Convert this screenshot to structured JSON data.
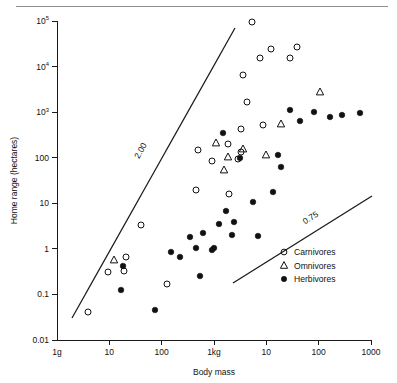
{
  "figure": {
    "has_top_rule": true,
    "background_color": "#ffffff",
    "ink_color": "#111111"
  },
  "chart_data": {
    "type": "scatter",
    "title": "",
    "subtitle": "",
    "xlabel": "Body mass",
    "ylabel": "Home range (hectares)",
    "xscale": "log",
    "yscale": "log",
    "grid": false,
    "xlim": [
      1,
      1000000
    ],
    "ylim": [
      0.01,
      100000
    ],
    "x_tick_labels": [
      "1g",
      "10",
      "100",
      "1kg",
      "10",
      "100",
      "1000"
    ],
    "x_tick_values": [
      1,
      10,
      100,
      1000,
      10000,
      100000,
      1000000
    ],
    "y_tick_labels": [
      "0.01",
      "0.1",
      "1",
      "10",
      "100",
      "10³",
      "10⁴",
      "10⁵"
    ],
    "y_tick_values": [
      0.01,
      0.1,
      1,
      10,
      100,
      1000,
      10000,
      100000
    ],
    "y_tick_mantissas": [
      "0.01",
      "0.1",
      "1",
      "10",
      "100",
      "10",
      "10",
      "10"
    ],
    "y_tick_exponents": [
      "",
      "",
      "",
      "",
      "",
      "3",
      "4",
      "5"
    ],
    "legend_position": "lower-right",
    "legend": [
      {
        "label": "Carnivores",
        "marker": "open-circle"
      },
      {
        "label": "Omnivores",
        "marker": "open-triangle"
      },
      {
        "label": "Herbivores",
        "marker": "filled-circle"
      }
    ],
    "annotations": [
      {
        "text": "2.00",
        "role": "slope-label",
        "line": "steep-regression-line",
        "rotation": -62
      },
      {
        "text": "0.75",
        "role": "slope-label",
        "line": "shallow-regression-line",
        "rotation": -32
      }
    ],
    "reference_lines": [
      {
        "name": "steep-regression-line",
        "slope_label": "2.00",
        "px": [
          [
            72,
            318
          ],
          [
            235,
            28
          ]
        ]
      },
      {
        "name": "shallow-regression-line",
        "slope_label": "0.75",
        "px": [
          [
            233,
            283
          ],
          [
            372,
            196
          ]
        ]
      }
    ],
    "series": [
      {
        "name": "Carnivores",
        "marker": "open-circle",
        "points_px": [
          [
            88,
            312
          ],
          [
            108,
            272
          ],
          [
            124,
            271
          ],
          [
            126,
            257
          ],
          [
            141,
            225
          ],
          [
            167,
            284
          ],
          [
            196,
            190
          ],
          [
            198,
            150
          ],
          [
            212,
            161
          ],
          [
            228,
            144
          ],
          [
            229,
            194
          ],
          [
            238,
            159
          ],
          [
            241,
            152
          ],
          [
            241,
            129
          ],
          [
            243,
            75
          ],
          [
            247,
            102
          ],
          [
            252,
            22
          ],
          [
            260,
            58
          ],
          [
            263,
            125
          ],
          [
            271,
            49
          ],
          [
            290,
            58
          ],
          [
            297,
            47
          ]
        ]
      },
      {
        "name": "Omnivores",
        "marker": "open-triangle",
        "points_px": [
          [
            114,
            260
          ],
          [
            216,
            143
          ],
          [
            224,
            170
          ],
          [
            228,
            157
          ],
          [
            243,
            149
          ],
          [
            266,
            155
          ],
          [
            281,
            124
          ],
          [
            320,
            92
          ]
        ]
      },
      {
        "name": "Herbivores",
        "marker": "filled-circle",
        "points_px": [
          [
            121,
            290
          ],
          [
            123,
            266
          ],
          [
            155,
            310
          ],
          [
            171,
            252
          ],
          [
            180,
            257
          ],
          [
            190,
            237
          ],
          [
            196,
            248
          ],
          [
            200,
            276
          ],
          [
            203,
            233
          ],
          [
            212,
            250
          ],
          [
            214,
            248
          ],
          [
            219,
            224
          ],
          [
            223,
            133
          ],
          [
            226,
            211
          ],
          [
            232,
            235
          ],
          [
            234,
            222
          ],
          [
            240,
            158
          ],
          [
            253,
            202
          ],
          [
            258,
            236
          ],
          [
            273,
            192
          ],
          [
            278,
            155
          ],
          [
            281,
            167
          ],
          [
            290,
            110
          ],
          [
            300,
            121
          ],
          [
            314,
            112
          ],
          [
            330,
            117
          ],
          [
            342,
            115
          ],
          [
            360,
            113
          ]
        ]
      }
    ]
  }
}
